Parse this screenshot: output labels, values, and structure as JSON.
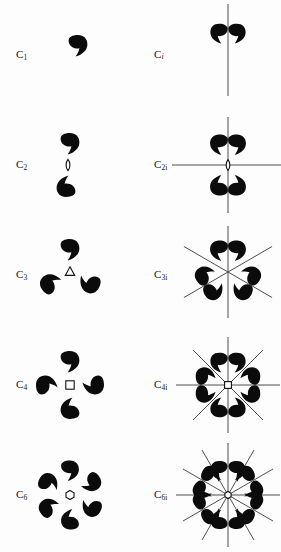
{
  "figure": {
    "columns": [
      "C_n",
      "C_ni"
    ],
    "ink_color": "#0b0b0b",
    "line_color": "#3b3b3b",
    "background": "#fdfdfd",
    "motif_icon": "comma-motif",
    "rows": [
      {
        "order": 1,
        "left": {
          "label_main": "C",
          "label_sub": "1",
          "axis_symbol": "none",
          "axis_symbol_icon": "no-axis-symbol",
          "comma_count": 1,
          "mirror_line_count": 0
        },
        "right": {
          "label_main": "C",
          "label_sub": "i",
          "axis_symbol": "none",
          "axis_symbol_icon": "no-axis-symbol",
          "comma_count": 2,
          "mirror_line_count": 1,
          "mirror_angles_deg": [
            90
          ]
        }
      },
      {
        "order": 2,
        "left": {
          "label_main": "C",
          "label_sub": "2",
          "axis_symbol": "lens",
          "axis_symbol_icon": "twofold-lens-icon",
          "comma_count": 2,
          "mirror_line_count": 0
        },
        "right": {
          "label_main": "C",
          "label_sub": "2i",
          "axis_symbol": "lens",
          "axis_symbol_icon": "twofold-lens-icon",
          "comma_count": 4,
          "mirror_line_count": 2,
          "mirror_angles_deg": [
            0,
            90
          ]
        }
      },
      {
        "order": 3,
        "left": {
          "label_main": "C",
          "label_sub": "3",
          "axis_symbol": "triangle",
          "axis_symbol_icon": "threefold-triangle-icon",
          "comma_count": 3,
          "mirror_line_count": 0
        },
        "right": {
          "label_main": "C",
          "label_sub": "3i",
          "axis_symbol": "triangle",
          "axis_symbol_icon": "threefold-triangle-icon",
          "comma_count": 6,
          "mirror_line_count": 3,
          "mirror_angles_deg": [
            90,
            30,
            150
          ]
        }
      },
      {
        "order": 4,
        "left": {
          "label_main": "C",
          "label_sub": "4",
          "axis_symbol": "square",
          "axis_symbol_icon": "fourfold-square-icon",
          "comma_count": 4,
          "mirror_line_count": 0
        },
        "right": {
          "label_main": "C",
          "label_sub": "4i",
          "axis_symbol": "square",
          "axis_symbol_icon": "fourfold-square-icon",
          "comma_count": 8,
          "mirror_line_count": 4,
          "mirror_angles_deg": [
            0,
            45,
            90,
            135
          ]
        }
      },
      {
        "order": 6,
        "left": {
          "label_main": "C",
          "label_sub": "6",
          "axis_symbol": "hexagon",
          "axis_symbol_icon": "sixfold-hexagon-icon",
          "comma_count": 6,
          "mirror_line_count": 0
        },
        "right": {
          "label_main": "C",
          "label_sub": "6i",
          "axis_symbol": "hexagon",
          "axis_symbol_icon": "sixfold-hexagon-icon",
          "comma_count": 12,
          "mirror_line_count": 6,
          "mirror_angles_deg": [
            0,
            30,
            60,
            90,
            120,
            150
          ]
        }
      }
    ]
  }
}
